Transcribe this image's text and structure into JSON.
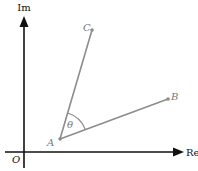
{
  "diagram": {
    "axes": {
      "x_label": "Re",
      "y_label": "Im",
      "origin_label": "O"
    },
    "points": {
      "A": {
        "label": "A",
        "x": 60,
        "y": 139
      },
      "B": {
        "label": "B",
        "x": 168,
        "y": 99
      },
      "C": {
        "label": "C",
        "x": 92,
        "y": 30
      }
    },
    "angle": {
      "label": "θ",
      "vertex": "A",
      "between": [
        "AB",
        "AC"
      ]
    },
    "colors": {
      "axis": "#111111",
      "segment": "#8c8c8c",
      "label_point": "#777777",
      "label_axis": "#111111"
    }
  }
}
